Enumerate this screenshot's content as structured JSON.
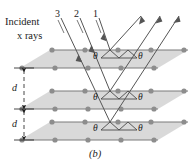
{
  "figure": {
    "caption": "(b)",
    "background_color": "#ffffff",
    "plane_fill_color": "#d9d9d9",
    "plane_edge_color": "#7a7a7a",
    "atom_color": "#8d8d8d",
    "ray_color": "#555555",
    "text_color": "#1b1b1b"
  },
  "labels": {
    "incident_line1": "Incident",
    "incident_line2": "x rays",
    "ray_numbers": [
      "3",
      "2",
      "1"
    ],
    "spacing_label": "d",
    "angle_symbol": "θ"
  },
  "angles": {
    "top_plane": {
      "left": "θ",
      "right": "θ"
    },
    "middle_plane": {
      "left": "θ",
      "right": "θ"
    },
    "bottom_plane": {
      "left": "θ",
      "right": "θ"
    }
  },
  "spacings": [
    {
      "label": "d"
    },
    {
      "label": "d"
    }
  ]
}
